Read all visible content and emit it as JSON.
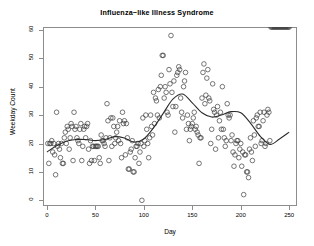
{
  "chart_data": {
    "type": "scatter",
    "title": "Influenza−like Illness Syndrome",
    "xlabel": "Day",
    "ylabel": "Weekday Count",
    "xlim": [
      -4,
      258
    ],
    "ylim": [
      -2,
      61
    ],
    "xticks": [
      0,
      50,
      100,
      150,
      200,
      250
    ],
    "yticks": [
      0,
      10,
      20,
      30,
      40,
      50,
      60
    ],
    "grid": false,
    "legend": null,
    "marker": {
      "shape": "open-circle",
      "size": 2.3,
      "color": "#3c3c3c",
      "fill": "none"
    },
    "smoother": {
      "name": "loess",
      "color": "#2b2b2b",
      "width": 1.1
    },
    "x": [
      1,
      2,
      3,
      4,
      5,
      6,
      7,
      8,
      9,
      10,
      11,
      12,
      13,
      14,
      15,
      16,
      17,
      18,
      19,
      20,
      21,
      22,
      23,
      24,
      25,
      26,
      27,
      28,
      29,
      30,
      31,
      32,
      33,
      34,
      35,
      36,
      37,
      38,
      39,
      40,
      41,
      42,
      43,
      44,
      45,
      46,
      47,
      48,
      49,
      50,
      51,
      52,
      53,
      54,
      55,
      56,
      57,
      58,
      59,
      60,
      61,
      62,
      63,
      64,
      65,
      66,
      67,
      68,
      69,
      70,
      71,
      72,
      73,
      74,
      75,
      76,
      77,
      78,
      79,
      80,
      81,
      82,
      83,
      84,
      85,
      86,
      87,
      88,
      89,
      90,
      91,
      92,
      93,
      94,
      95,
      96,
      97,
      98,
      99,
      100,
      101,
      102,
      103,
      104,
      105,
      106,
      107,
      108,
      109,
      110,
      111,
      112,
      113,
      114,
      115,
      116,
      117,
      118,
      119,
      120,
      121,
      122,
      123,
      124,
      125,
      126,
      127,
      128,
      129,
      130,
      131,
      132,
      133,
      134,
      135,
      136,
      137,
      138,
      139,
      140,
      141,
      142,
      143,
      144,
      145,
      146,
      147,
      148,
      149,
      150,
      151,
      152,
      153,
      154,
      155,
      156,
      157,
      158,
      159,
      160,
      161,
      162,
      163,
      164,
      165,
      166,
      167,
      168,
      169,
      170,
      171,
      172,
      173,
      174,
      175,
      176,
      177,
      178,
      179,
      180,
      181,
      182,
      183,
      184,
      185,
      186,
      187,
      188,
      189,
      190,
      191,
      192,
      193,
      194,
      195,
      196,
      197,
      198,
      199,
      200,
      201,
      202,
      203,
      204,
      205,
      206,
      207,
      208,
      209,
      210,
      211,
      212,
      213,
      214,
      215,
      216,
      217,
      218,
      219,
      220,
      221,
      222,
      223,
      224,
      225,
      226,
      227,
      228,
      229,
      230,
      231,
      232,
      233,
      234,
      235,
      236,
      237,
      238,
      239,
      240,
      241,
      242,
      243,
      244,
      245,
      246,
      247,
      248,
      249,
      250
    ],
    "y": [
      20,
      13,
      20,
      20,
      21,
      17,
      20,
      16,
      9,
      31,
      19,
      20,
      18,
      15,
      20,
      13,
      13,
      22,
      24,
      20,
      26,
      25,
      18,
      22,
      27,
      26,
      14,
      31,
      25,
      26,
      22,
      21,
      20,
      25,
      27,
      14,
      19,
      25,
      26,
      22,
      26,
      27,
      18,
      13,
      21,
      14,
      19,
      19,
      14,
      19,
      19,
      19,
      19,
      15,
      13,
      23,
      21,
      21,
      20,
      19,
      22,
      34,
      28,
      14,
      22,
      29,
      19,
      29,
      26,
      20,
      22,
      24,
      26,
      21,
      28,
      20,
      15,
      31,
      27,
      28,
      16,
      27,
      22,
      11,
      11,
      17,
      18,
      21,
      10,
      10,
      15,
      19,
      19,
      20,
      13,
      17,
      20,
      0,
      29,
      19,
      21,
      30,
      25,
      20,
      15,
      22,
      30,
      26,
      23,
      38,
      27,
      36,
      35,
      30,
      39,
      29,
      40,
      44,
      51,
      51,
      36,
      40,
      38,
      31,
      30,
      46,
      41,
      58,
      38,
      33,
      42,
      24,
      33,
      44,
      45,
      47,
      46,
      36,
      31,
      29,
      40,
      42,
      45,
      25,
      30,
      27,
      21,
      25,
      26,
      27,
      29,
      31,
      25,
      26,
      24,
      23,
      13,
      22,
      22,
      36,
      45,
      48,
      34,
      37,
      43,
      46,
      36,
      35,
      20,
      25,
      41,
      32,
      31,
      18,
      30,
      33,
      22,
      28,
      31,
      25,
      40,
      25,
      22,
      19,
      21,
      34,
      30,
      29,
      30,
      21,
      23,
      17,
      12,
      16,
      20,
      21,
      21,
      15,
      18,
      20,
      12,
      17,
      2,
      16,
      16,
      10,
      10,
      8,
      18,
      22,
      17,
      14,
      28,
      23,
      19,
      29,
      30,
      26,
      26,
      31,
      20,
      21,
      28,
      31,
      19,
      20,
      30,
      32,
      31,
      21
    ],
    "loess_fit": {
      "x": [
        0,
        10,
        20,
        30,
        40,
        50,
        60,
        70,
        80,
        90,
        100,
        110,
        120,
        130,
        140,
        150,
        160,
        170,
        180,
        190,
        200,
        210,
        220,
        230,
        240,
        250
      ],
      "y": [
        17.0,
        19.2,
        20.8,
        21.4,
        21.4,
        21.0,
        21.4,
        22.4,
        21.9,
        20.5,
        21.6,
        25.5,
        30.6,
        35.6,
        37.4,
        34.3,
        30.8,
        29.3,
        30.0,
        31.2,
        30.8,
        27.2,
        22.6,
        19.7,
        21.6,
        24.0
      ]
    }
  },
  "colors": {
    "axis": "#8d8d8d",
    "text": "#000000",
    "marker": "#3c3c3c",
    "line": "#2b2b2b",
    "background": "#ffffff"
  }
}
